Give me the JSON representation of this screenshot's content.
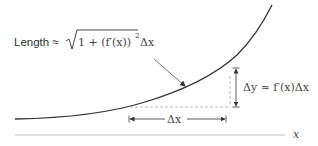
{
  "diagram": {
    "type": "arc-length-approximation",
    "colors": {
      "curve": "#333333",
      "axis": "#aaaaaa",
      "dashed": "#aaaaaa",
      "arrow": "#333333",
      "text": "#333333"
    },
    "labels": {
      "length_prefix": "Length ≈",
      "length_formula": "√(1 + (f′(x))²) Δx",
      "sqrt_inner": "1 + (f′(x))",
      "sqrt_exponent": "2",
      "delta_x_after_sqrt": "Δx",
      "delta_y_label": "Δy ≈ f′(x)Δx",
      "delta_x_label": "Δx",
      "x_axis_label": "x"
    }
  }
}
